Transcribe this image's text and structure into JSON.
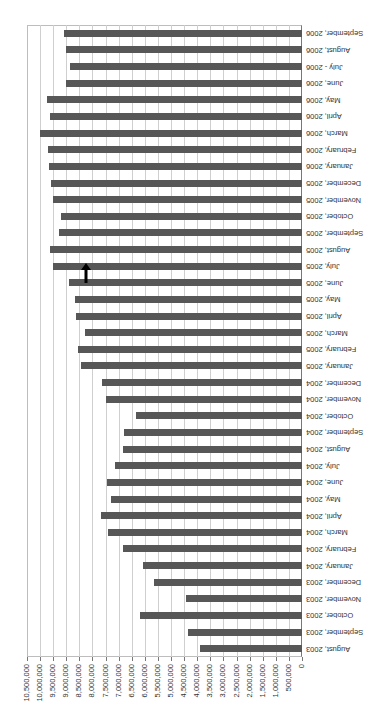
{
  "chart_data": {
    "type": "bar",
    "orientation": "horizontal-rotated",
    "title": "",
    "xlabel": "",
    "ylabel": "",
    "ylim": [
      0,
      10500000
    ],
    "grid": true,
    "legend": null,
    "tick_labels": [
      "0",
      "500,000",
      "1,000,000",
      "1,500,000",
      "2,000,000",
      "2,500,000",
      "3,000,000",
      "3,500,000",
      "4,000,000",
      "4,500,000",
      "5,000,000",
      "5,500,000",
      "6,000,000",
      "6,500,000",
      "7,000,000",
      "7,500,000",
      "8,000,000",
      "8,500,000",
      "9,000,000",
      "9,500,000",
      "10,000,000",
      "10,500,000"
    ],
    "categories": [
      "August, 2003",
      "September, 2003",
      "October, 2003",
      "November, 2003",
      "December, 2003",
      "January, 2004",
      "February, 2004",
      "March, 2004",
      "April, 2004",
      "May, 2004",
      "June, 2004",
      "July, 2004",
      "August, 2004",
      "September, 2004",
      "October, 2004",
      "November, 2004",
      "December, 2004",
      "January, 2005",
      "February, 2005",
      "March, 2005",
      "April, 2005",
      "May, 2005",
      "June, 2005",
      "July, 2005",
      "August, 2005",
      "September, 2005",
      "October, 2005",
      "November, 2005",
      "December, 2005",
      "January, 2006",
      "February, 2006",
      "March, 2006",
      "April, 2006",
      "May, 2006",
      "June, 2006",
      "July - 2006",
      "August, 2006",
      "September, 2006"
    ],
    "values": [
      3900000,
      4360000,
      6190000,
      4430000,
      5660000,
      6090000,
      6850000,
      7390000,
      7680000,
      7310000,
      7440000,
      7150000,
      6850000,
      6800000,
      6320000,
      7490000,
      7620000,
      8420000,
      8550000,
      8300000,
      8640000,
      8680000,
      8910000,
      9510000,
      9630000,
      9290000,
      9190000,
      9510000,
      9570000,
      9670000,
      9700000,
      10000000,
      9610000,
      9740000,
      9000000,
      8870000,
      9000000,
      9100000
    ],
    "bar_color": "#575757",
    "annotation": {
      "type": "arrow",
      "near_category": "July, 2005",
      "color": "#000000"
    }
  }
}
